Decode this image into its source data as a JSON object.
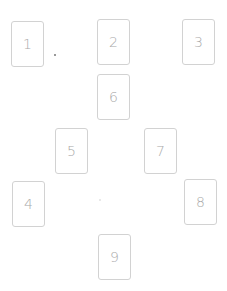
{
  "layout": {
    "background": "#ffffff",
    "card_border_color": "#d2d2d2",
    "card_text_color": "#a9a9a9"
  },
  "cards": [
    {
      "label": "1",
      "x": 11,
      "y": 21
    },
    {
      "label": "2",
      "x": 97,
      "y": 19
    },
    {
      "label": "3",
      "x": 182,
      "y": 19
    },
    {
      "label": "4",
      "x": 12,
      "y": 181
    },
    {
      "label": "5",
      "x": 55,
      "y": 128
    },
    {
      "label": "6",
      "x": 97,
      "y": 74
    },
    {
      "label": "7",
      "x": 144,
      "y": 128
    },
    {
      "label": "8",
      "x": 184,
      "y": 179
    },
    {
      "label": "9",
      "x": 98,
      "y": 234
    }
  ],
  "markers": [
    {
      "x": 54,
      "y": 54,
      "color": "#777777"
    },
    {
      "x": 99,
      "y": 199,
      "color": "#e2e2e2"
    }
  ]
}
